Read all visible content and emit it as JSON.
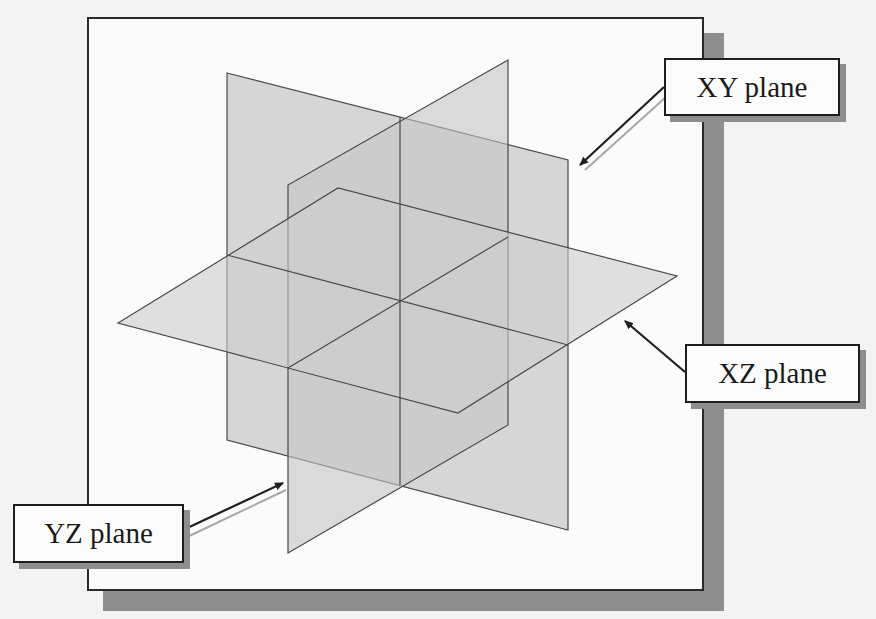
{
  "diagram": {
    "labels": {
      "xy": "XY plane",
      "xz": "XZ plane",
      "yz": "YZ plane"
    },
    "colors": {
      "plane_fill": "#c9c9c9",
      "plane_edge": "#4a4a4a",
      "frame_border": "#2a2a2a",
      "shadow": "#8e8e8e",
      "arrow": "#1e1e1e",
      "arrow_highlight": "#a8a8a8"
    }
  }
}
